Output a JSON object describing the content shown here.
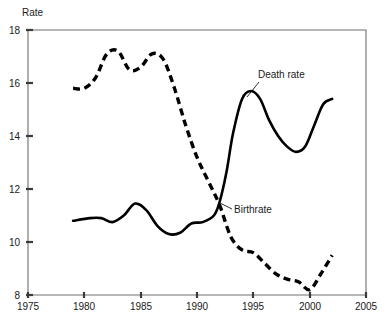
{
  "chart_data": {
    "type": "line",
    "title": "",
    "xlabel": "",
    "ylabel": "Rate",
    "xlim": [
      1975,
      2005
    ],
    "ylim": [
      8,
      18
    ],
    "grid": false,
    "legend_position": "inline-annotations",
    "x_ticks": [
      "1975",
      "1980",
      "1985",
      "1990",
      "1995",
      "2000",
      "2005"
    ],
    "y_ticks": [
      "8",
      "10",
      "12",
      "14",
      "16",
      "18"
    ],
    "series": [
      {
        "name": "Death rate",
        "style": "solid",
        "label_text": "Death rate",
        "x": [
          1979.0,
          1980.5,
          1981.5,
          1982.5,
          1983.5,
          1984.5,
          1985.5,
          1986.5,
          1987.5,
          1988.5,
          1989.5,
          1990.5,
          1991.5,
          1992.0,
          1992.6,
          1993.2,
          1994.0,
          1994.8,
          1995.6,
          1996.4,
          1997.2,
          1998.0,
          1998.8,
          1999.6,
          2000.4,
          2001.2,
          2002.0
        ],
        "y": [
          10.8,
          10.9,
          10.9,
          10.75,
          11.0,
          11.45,
          11.2,
          10.6,
          10.3,
          10.35,
          10.7,
          10.75,
          11.0,
          11.5,
          12.6,
          14.1,
          15.4,
          15.7,
          15.4,
          14.6,
          14.0,
          13.6,
          13.4,
          13.6,
          14.4,
          15.2,
          15.4
        ]
      },
      {
        "name": "Birthrate",
        "style": "dashed",
        "label_text": "Birthrate",
        "x": [
          1979.0,
          1980.0,
          1981.0,
          1982.0,
          1983.0,
          1984.0,
          1985.0,
          1986.0,
          1987.0,
          1988.0,
          1989.0,
          1990.0,
          1991.0,
          1992.0,
          1993.0,
          1994.0,
          1995.0,
          1996.0,
          1997.0,
          1998.0,
          1999.0,
          2000.0,
          2001.0,
          2002.0
        ],
        "y": [
          15.8,
          15.8,
          16.2,
          17.1,
          17.2,
          16.5,
          16.6,
          17.1,
          16.9,
          15.8,
          14.4,
          13.2,
          12.3,
          11.4,
          10.2,
          9.7,
          9.6,
          9.2,
          8.8,
          8.6,
          8.5,
          8.2,
          8.8,
          9.5
        ]
      }
    ],
    "annotations": [
      {
        "text": "Death rate",
        "label_x": 258,
        "label_y": 78,
        "anchor_x": 247,
        "anchor_y": 96
      },
      {
        "text": "Birthrate",
        "label_x": 234,
        "label_y": 212,
        "anchor_x": 220,
        "anchor_y": 203
      }
    ]
  }
}
